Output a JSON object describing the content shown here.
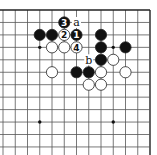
{
  "diagram": {
    "type": "go-board-fragment",
    "corner": "top-right",
    "visible_columns_from_right": 13,
    "visible_rows_from_top": 12,
    "edges": [
      "top",
      "right"
    ],
    "colors": {
      "background": "#ffffff",
      "line": "#555555",
      "edge_line": "#222222",
      "black_stone": "#111111",
      "white_stone": "#ffffff",
      "stone_outline": "#222222"
    },
    "star_points": [
      {
        "col": 10,
        "row": 4
      },
      {
        "col": 4,
        "row": 4
      },
      {
        "col": 10,
        "row": 10
      },
      {
        "col": 4,
        "row": 10
      }
    ],
    "stones": [
      {
        "color": "black",
        "col": 10,
        "row": 3,
        "label": ""
      },
      {
        "color": "black",
        "col": 9,
        "row": 3,
        "label": ""
      },
      {
        "color": "white",
        "col": 8,
        "row": 3,
        "label": "2"
      },
      {
        "color": "black",
        "col": 7,
        "row": 3,
        "label": "1"
      },
      {
        "color": "black",
        "col": 8,
        "row": 2,
        "label": "3"
      },
      {
        "color": "white",
        "col": 9,
        "row": 4,
        "label": ""
      },
      {
        "color": "white",
        "col": 8,
        "row": 4,
        "label": ""
      },
      {
        "color": "white",
        "col": 7,
        "row": 4,
        "label": "4"
      },
      {
        "color": "black",
        "col": 5,
        "row": 3,
        "label": ""
      },
      {
        "color": "black",
        "col": 5,
        "row": 4,
        "label": ""
      },
      {
        "color": "black",
        "col": 3,
        "row": 4,
        "label": ""
      },
      {
        "color": "black",
        "col": 5,
        "row": 5,
        "label": ""
      },
      {
        "color": "white",
        "col": 4,
        "row": 5,
        "label": ""
      },
      {
        "color": "white",
        "col": 9,
        "row": 6,
        "label": ""
      },
      {
        "color": "black",
        "col": 7,
        "row": 6,
        "label": ""
      },
      {
        "color": "black",
        "col": 6,
        "row": 6,
        "label": ""
      },
      {
        "color": "white",
        "col": 5,
        "row": 6,
        "label": ""
      },
      {
        "color": "white",
        "col": 3,
        "row": 6,
        "label": ""
      },
      {
        "color": "white",
        "col": 6,
        "row": 7,
        "label": ""
      },
      {
        "color": "white",
        "col": 5,
        "row": 7,
        "label": ""
      }
    ],
    "marks": [
      {
        "text": "a",
        "col": 7,
        "row": 2
      },
      {
        "text": "b",
        "col": 6,
        "row": 5
      }
    ]
  }
}
